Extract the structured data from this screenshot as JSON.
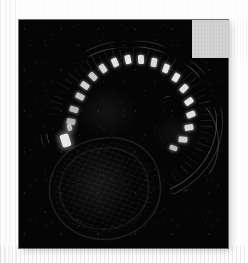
{
  "page": {
    "background_color": "#fdfdfd",
    "width": 248,
    "height": 263,
    "ghost_caption": ""
  },
  "figure": {
    "panel": {
      "name": "micrograph-panel",
      "background_color": "#050505",
      "x": 19,
      "y": 20,
      "width": 209,
      "height": 228
    },
    "occluder": {
      "name": "gray-occluder",
      "color": "#d2d2d2",
      "x": 192,
      "y": 20,
      "width": 38,
      "height": 38
    }
  },
  "chart_data": {
    "type": "heatmap",
    "title": "",
    "subtitle": "",
    "xlabel": "",
    "ylabel": "",
    "legend": [],
    "annotations": [],
    "colormap": "grayscale",
    "value_range": [
      0,
      255
    ],
    "background_value": 5,
    "features": {
      "dorsal_arc": {
        "cx": 111,
        "cy": 101,
        "rx": 85,
        "ry": 75
      },
      "tail_curve": {
        "cx": 159,
        "cy": 122,
        "rx": 39,
        "ry": 48
      },
      "yolk_sac": {
        "cx": 85,
        "cy": 168,
        "rx": 55,
        "ry": 50,
        "rotation": -9
      },
      "head_spot": {
        "x": 42,
        "y": 114,
        "w": 9,
        "h": 13,
        "intensity": 235
      }
    },
    "somites": [
      {
        "x": 58,
        "y": 72,
        "w": 6,
        "h": 9,
        "angle": -62,
        "intensity": 210
      },
      {
        "x": 63,
        "y": 61,
        "w": 6,
        "h": 9,
        "angle": -55,
        "intensity": 225
      },
      {
        "x": 71,
        "y": 52,
        "w": 6,
        "h": 9,
        "angle": -46,
        "intensity": 215
      },
      {
        "x": 81,
        "y": 44,
        "w": 6,
        "h": 9,
        "angle": -36,
        "intensity": 230
      },
      {
        "x": 93,
        "y": 38,
        "w": 6,
        "h": 9,
        "angle": -24,
        "intensity": 245
      },
      {
        "x": 106,
        "y": 35,
        "w": 6,
        "h": 9,
        "angle": -12,
        "intensity": 250
      },
      {
        "x": 119,
        "y": 35,
        "w": 6,
        "h": 9,
        "angle": -2,
        "intensity": 240
      },
      {
        "x": 132,
        "y": 38,
        "w": 6,
        "h": 9,
        "angle": 9,
        "intensity": 235
      },
      {
        "x": 144,
        "y": 44,
        "w": 6,
        "h": 9,
        "angle": 20,
        "intensity": 245
      },
      {
        "x": 154,
        "y": 53,
        "w": 6,
        "h": 9,
        "angle": 32,
        "intensity": 250
      },
      {
        "x": 162,
        "y": 64,
        "w": 6,
        "h": 9,
        "angle": 44,
        "intensity": 240
      },
      {
        "x": 167,
        "y": 77,
        "w": 6,
        "h": 9,
        "angle": 56,
        "intensity": 248
      },
      {
        "x": 169,
        "y": 90,
        "w": 6,
        "h": 9,
        "angle": 68,
        "intensity": 238
      },
      {
        "x": 167,
        "y": 103,
        "w": 6,
        "h": 9,
        "angle": 80,
        "intensity": 230
      },
      {
        "x": 161,
        "y": 115,
        "w": 6,
        "h": 9,
        "angle": 94,
        "intensity": 222
      },
      {
        "x": 152,
        "y": 124,
        "w": 5,
        "h": 8,
        "angle": 108,
        "intensity": 200
      },
      {
        "x": 52,
        "y": 85,
        "w": 6,
        "h": 9,
        "angle": -72,
        "intensity": 195
      },
      {
        "x": 49,
        "y": 97,
        "w": 6,
        "h": 9,
        "angle": -80,
        "intensity": 185
      }
    ],
    "striation_count": 46
  }
}
